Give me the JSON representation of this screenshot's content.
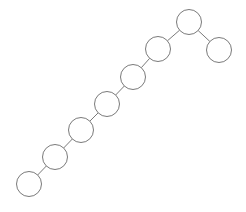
{
  "diagram": {
    "type": "binary-tree",
    "colors": {
      "stroke": "#7a7a7a",
      "fill": "#ffffff",
      "background": "#ffffff"
    },
    "node_radius": 12.5,
    "nodes": [
      {
        "id": "n0",
        "x": 189,
        "y": 22,
        "label": ""
      },
      {
        "id": "n1",
        "x": 158,
        "y": 49,
        "label": ""
      },
      {
        "id": "n2",
        "x": 219,
        "y": 50,
        "label": ""
      },
      {
        "id": "n3",
        "x": 133,
        "y": 77,
        "label": ""
      },
      {
        "id": "n4",
        "x": 107,
        "y": 104,
        "label": ""
      },
      {
        "id": "n5",
        "x": 81,
        "y": 130,
        "label": ""
      },
      {
        "id": "n6",
        "x": 55,
        "y": 157,
        "label": ""
      },
      {
        "id": "n7",
        "x": 29,
        "y": 184,
        "label": ""
      }
    ],
    "edges": [
      {
        "from": "n0",
        "to": "n1"
      },
      {
        "from": "n0",
        "to": "n2"
      },
      {
        "from": "n1",
        "to": "n3"
      },
      {
        "from": "n3",
        "to": "n4"
      },
      {
        "from": "n4",
        "to": "n5"
      },
      {
        "from": "n5",
        "to": "n6"
      },
      {
        "from": "n6",
        "to": "n7"
      }
    ]
  }
}
